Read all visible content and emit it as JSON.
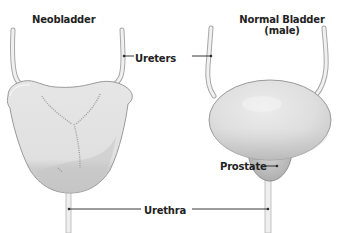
{
  "titles": {
    "left": "Neobladder",
    "right_line1": "Normal Bladder",
    "right_line2": "(male)"
  },
  "labels": {
    "ureters": "Ureters",
    "urethra": "Urethra",
    "prostate": "Prostate"
  },
  "colors": {
    "background": "#ffffff",
    "organ_fill": "#e4e4e4",
    "organ_shade": "#c9c9c9",
    "organ_outline": "#9a9a9a",
    "tube_fill": "#eeeeee",
    "tube_outline": "#a8a8a8",
    "stitch": "#a0a0a0",
    "leader_line": "#222222",
    "text": "#222222"
  }
}
